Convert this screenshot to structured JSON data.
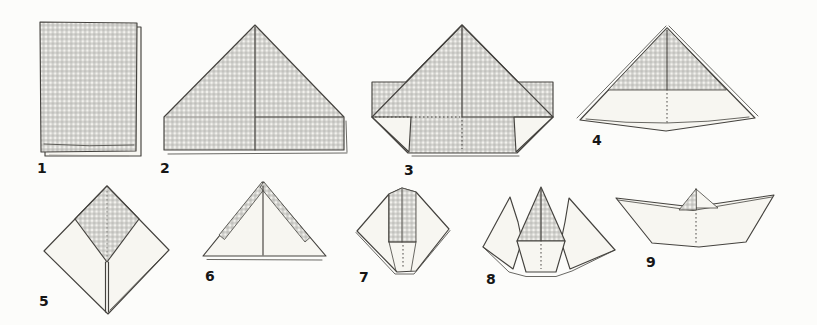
{
  "diagram": {
    "step_count": 9
  },
  "steps": [
    {
      "label": "1",
      "icon": "folded-checkered-sheet"
    },
    {
      "label": "2",
      "icon": "corner-folded-triangle"
    },
    {
      "label": "3",
      "icon": "bottom-strip-folded-up"
    },
    {
      "label": "4",
      "icon": "paper-hat"
    },
    {
      "label": "5",
      "icon": "flattened-diamond-square"
    },
    {
      "label": "6",
      "icon": "point-folded-triangle"
    },
    {
      "label": "7",
      "icon": "refolded-narrow-diamond"
    },
    {
      "label": "8",
      "icon": "opened-crown-shape"
    },
    {
      "label": "9",
      "icon": "finished-paper-boat"
    }
  ],
  "colors": {
    "background": "#fcfcfa",
    "outline": "#44423e",
    "faint_line": "#908e89",
    "paper_white": "#f7f6f1",
    "gingham_base": "#f3f2ee",
    "gingham_stripe": "#aeada9",
    "label": "#161616"
  }
}
